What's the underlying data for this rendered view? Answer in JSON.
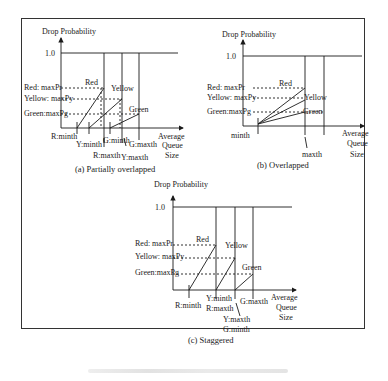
{
  "figure": {
    "panels": [
      {
        "id": "a",
        "caption": "(a) Partially overlapped",
        "y_axis_label": "Drop Probability",
        "x_axis_label": [
          "Average",
          "Queue",
          "Size"
        ],
        "y_tick": "1.0",
        "levels": [
          "Red: maxPr",
          "Yellow: maxPy",
          "Green:maxPg"
        ],
        "curve_labels": [
          "Red",
          "Yellow",
          "Green"
        ],
        "x_labels": [
          "R:minth",
          "Y:minth",
          "G:minth",
          "R:maxth",
          "Y:maxth",
          "G:maxth"
        ]
      },
      {
        "id": "b",
        "caption": "(b) Overlapped",
        "y_axis_label": "Drop Probability",
        "x_axis_label": [
          "Average",
          "Queue",
          "Size"
        ],
        "y_tick": "1.0",
        "levels": [
          "Red: maxPr",
          "Yellow: maxPy",
          "Green:maxPg"
        ],
        "curve_labels": [
          "Red",
          "Yellow",
          "Green"
        ],
        "x_labels": [
          "minth",
          "maxth"
        ]
      },
      {
        "id": "c",
        "caption": "(c) Staggered",
        "y_axis_label": "Drop Probability",
        "x_axis_label": [
          "Average",
          "Queue",
          "Size"
        ],
        "y_tick": "1.0",
        "levels": [
          "Red: maxPr",
          "Yellow: maxPy",
          "Green:maxPg"
        ],
        "curve_labels": [
          "Red",
          "Yellow",
          "Green"
        ],
        "x_labels": [
          "R:minth",
          "Y:minth",
          "R:maxth",
          "G:maxth",
          "Y:maxth",
          "G:minth"
        ]
      }
    ]
  }
}
